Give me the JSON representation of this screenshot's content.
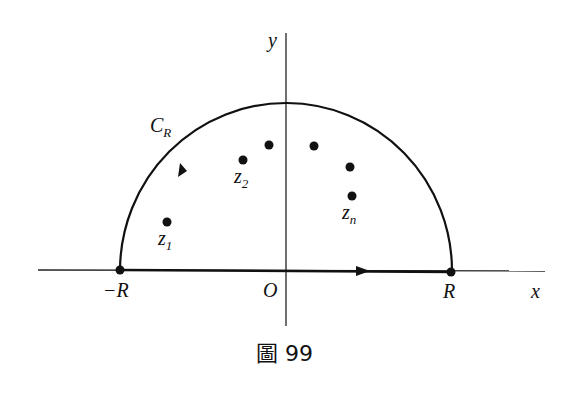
{
  "figure": {
    "caption": "圖 99",
    "axes": {
      "x_label": "x",
      "y_label": "y",
      "origin_label": "O"
    },
    "points_on_axis": {
      "left": "−R",
      "right": "R"
    },
    "contour_label": {
      "main": "C",
      "sub": "R"
    },
    "singularities": [
      {
        "label": "z",
        "sub": "1"
      },
      {
        "label": "z",
        "sub": "2"
      },
      {
        "label": "",
        "sub": ""
      },
      {
        "label": "",
        "sub": ""
      },
      {
        "label": "",
        "sub": ""
      },
      {
        "label": "z",
        "sub": "n"
      }
    ],
    "colors": {
      "ink": "#111111",
      "background": "#ffffff"
    }
  }
}
